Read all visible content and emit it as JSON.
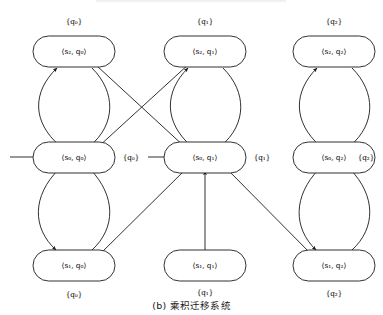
{
  "figure": {
    "caption": "(b) 乘积迁移系统",
    "background_color": "#ffffff",
    "stroke_color": "#1a1a1a"
  },
  "diagram": {
    "type": "product-transition-system",
    "nodes": [
      {
        "id": "s2q0",
        "label": "⟨s₂, q₀⟩",
        "prop": "{q₀}",
        "prop_position": "above",
        "col": 0,
        "row": 0,
        "cx": 74,
        "cy": 52
      },
      {
        "id": "s0q0",
        "label": "⟨s₀, q₀⟩",
        "prop": "{q₀}",
        "prop_position": "right",
        "col": 0,
        "row": 1,
        "cx": 74,
        "cy": 157
      },
      {
        "id": "s1q0",
        "label": "⟨s₁, q₀⟩",
        "prop": "{q₀}",
        "prop_position": "below",
        "col": 0,
        "row": 2,
        "cx": 74,
        "cy": 265
      },
      {
        "id": "s2q1",
        "label": "⟨s₂, q₁⟩",
        "prop": "{q₁}",
        "prop_position": "above",
        "col": 1,
        "row": 0,
        "cx": 205,
        "cy": 52
      },
      {
        "id": "s0q1",
        "label": "⟨s₀, q₁⟩",
        "prop": "{q₁}",
        "prop_position": "right",
        "col": 1,
        "row": 1,
        "cx": 205,
        "cy": 157
      },
      {
        "id": "s1q1",
        "label": "⟨s₁, q₁⟩",
        "prop": "{q₁}",
        "prop_position": "below",
        "col": 1,
        "row": 2,
        "cx": 205,
        "cy": 265
      },
      {
        "id": "s2q2",
        "label": "⟨s₂, q₂⟩",
        "prop": "{q₂}",
        "prop_position": "above",
        "col": 2,
        "row": 0,
        "cx": 334,
        "cy": 52
      },
      {
        "id": "s0q2",
        "label": "⟨s₀, q₂⟩",
        "prop": "{q₂}",
        "prop_position": "right",
        "col": 2,
        "row": 1,
        "cx": 334,
        "cy": 157
      },
      {
        "id": "s1q2",
        "label": "⟨s₁, q₂⟩",
        "prop": "{q₂}",
        "prop_position": "below",
        "col": 2,
        "row": 2,
        "cx": 334,
        "cy": 265
      }
    ],
    "initial_states": [
      "s0q0",
      "s0q1"
    ],
    "edges": [
      {
        "from": "s0q0",
        "to": "s2q0",
        "kind": "curve-left"
      },
      {
        "from": "s2q0",
        "to": "s0q0",
        "kind": "curve-right"
      },
      {
        "from": "s0q0",
        "to": "s1q0",
        "kind": "curve-left"
      },
      {
        "from": "s1q0",
        "to": "s0q0",
        "kind": "curve-right"
      },
      {
        "from": "s0q1",
        "to": "s2q1",
        "kind": "curve-left"
      },
      {
        "from": "s2q1",
        "to": "s0q1",
        "kind": "curve-right"
      },
      {
        "from": "s0q2",
        "to": "s2q2",
        "kind": "curve-left"
      },
      {
        "from": "s2q2",
        "to": "s0q2",
        "kind": "curve-right"
      },
      {
        "from": "s0q2",
        "to": "s1q2",
        "kind": "curve-left"
      },
      {
        "from": "s1q2",
        "to": "s0q2",
        "kind": "curve-right"
      },
      {
        "from": "s2q0",
        "to": "s0q1",
        "kind": "diagonal"
      },
      {
        "from": "s0q0",
        "to": "s2q1",
        "kind": "diagonal"
      },
      {
        "from": "s1q0",
        "to": "s0q1",
        "kind": "diagonal"
      },
      {
        "from": "s1q1",
        "to": "s0q1",
        "kind": "vertical"
      },
      {
        "from": "s0q1",
        "to": "s1q2",
        "kind": "diagonal"
      }
    ]
  }
}
